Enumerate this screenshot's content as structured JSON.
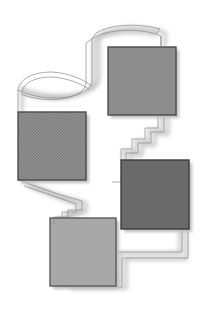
{
  "canvas": {
    "width": 205,
    "height": 310,
    "background": "#ffffff",
    "title": "Abstract grayscale flow diagram"
  },
  "palette": {
    "background": "#ffffff",
    "node_border": "#4a4a4a",
    "node_fill_medium": "#8d8d8d",
    "node_fill_hatched": "#8a8a8a",
    "node_fill_dark": "#6a6a6a",
    "node_fill_light": "#a8a8a8",
    "ribbon_stroke": "#7d7d7d",
    "ribbon_outline": "#9a9a9a",
    "shadow": "#b5b5b5"
  },
  "nodes": [
    {
      "id": "node-top-right",
      "label": "",
      "x": 108,
      "y": 47,
      "width": 68,
      "height": 68,
      "fill": "#8d8d8d",
      "texture": "plain",
      "border": "#4a4a4a"
    },
    {
      "id": "node-left",
      "label": "",
      "x": 18,
      "y": 112,
      "width": 68,
      "height": 68,
      "fill": "#8a8a8a",
      "texture": "hatch",
      "border": "#4a4a4a"
    },
    {
      "id": "node-dark-right",
      "label": "",
      "x": 121,
      "y": 160,
      "width": 68,
      "height": 69,
      "fill": "#6a6a6a",
      "texture": "plain",
      "border": "#3d3d3d"
    },
    {
      "id": "node-bottom-left",
      "label": "",
      "x": 50,
      "y": 218,
      "width": 66,
      "height": 68,
      "fill": "#a8a8a8",
      "texture": "plain",
      "border": "#5a5a5a"
    }
  ],
  "connectors": [
    {
      "id": "connector-top-loop",
      "from": "node-top-right",
      "to": "node-top-right",
      "shape": "curved-ribbon",
      "stroke": "#8f8f8f"
    },
    {
      "id": "connector-top-to-left",
      "from": "node-top-right",
      "to": "node-left",
      "shape": "curved-ribbon",
      "stroke": "#8f8f8f"
    },
    {
      "id": "connector-top-to-dark",
      "from": "node-top-right",
      "to": "node-dark-right",
      "shape": "zigzag-ribbon",
      "stroke": "#8f8f8f"
    },
    {
      "id": "connector-left-to-bottom",
      "from": "node-left",
      "to": "node-bottom-left",
      "shape": "stepped-ribbon",
      "stroke": "#8f8f8f"
    },
    {
      "id": "connector-dark-to-bottom",
      "from": "node-dark-right",
      "to": "node-bottom-left",
      "shape": "stepped-ribbon",
      "stroke": "#8f8f8f"
    }
  ]
}
